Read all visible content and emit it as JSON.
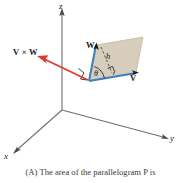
{
  "figure": {
    "axes": {
      "z_label": "z",
      "y_label": "y",
      "x_label": "x"
    },
    "vectors": {
      "w_label": "W",
      "v_label": "V",
      "cross_label": "V × W"
    },
    "annotations": {
      "angle_label": "θ",
      "height_label": "h"
    },
    "colors": {
      "parallelogram_fill": "#d6cdbc",
      "parallelogram_edge_blue": "#3a7fc1",
      "cross_arrow_red": "#e03a2f",
      "axis_gray": "#6f6f6f",
      "dashed_gray": "#4a4a4a"
    }
  },
  "caption": {
    "text": "(A) The area of the parallelogram P is"
  }
}
